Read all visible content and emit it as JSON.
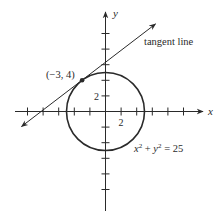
{
  "diagram": {
    "type": "circle-with-tangent-line",
    "axes": {
      "x_label": "x",
      "y_label": "y",
      "x_tick_label": "2",
      "y_tick_label": "2",
      "tick_spacing_units": 2,
      "ticks_per_side": 5
    },
    "circle": {
      "equation": "x² + y² = 25",
      "equation_parts": {
        "x": "x",
        "xexp": "2",
        "plus": " + ",
        "y": "y",
        "yexp": "2",
        "rhs": " = 25"
      },
      "center": [
        0,
        0
      ],
      "radius": 5
    },
    "tangent": {
      "label": "tangent line",
      "point_label": "(−3, 4)",
      "point": [
        -3,
        4
      ],
      "slope": 0.75,
      "y_intercept": 6.25
    },
    "colors": {
      "stroke": "#2a2a2a",
      "background": "#ffffff"
    }
  }
}
